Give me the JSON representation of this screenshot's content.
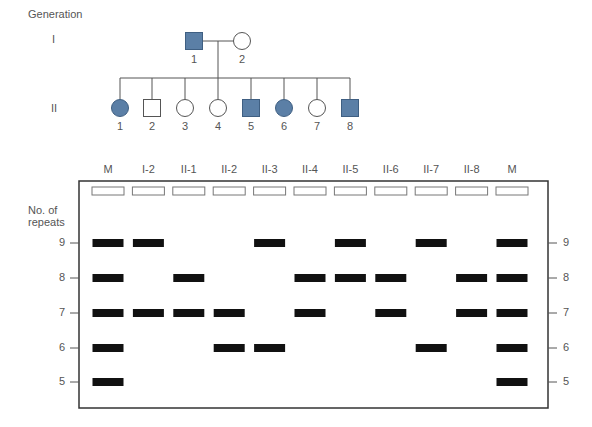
{
  "pedigree": {
    "generation_label": "Generation",
    "generations": [
      {
        "roman": "I",
        "members": [
          {
            "id": "1",
            "sex": "male",
            "affected": true,
            "x": 194
          },
          {
            "id": "2",
            "sex": "female",
            "affected": false,
            "x": 242
          }
        ]
      },
      {
        "roman": "II",
        "members": [
          {
            "id": "1",
            "sex": "female",
            "affected": true,
            "x": 120
          },
          {
            "id": "2",
            "sex": "male",
            "affected": false,
            "x": 152
          },
          {
            "id": "3",
            "sex": "female",
            "affected": false,
            "x": 185
          },
          {
            "id": "4",
            "sex": "female",
            "affected": false,
            "x": 218
          },
          {
            "id": "5",
            "sex": "male",
            "affected": true,
            "x": 251
          },
          {
            "id": "6",
            "sex": "female",
            "affected": true,
            "x": 284
          },
          {
            "id": "7",
            "sex": "female",
            "affected": false,
            "x": 317
          },
          {
            "id": "8",
            "sex": "male",
            "affected": true,
            "x": 350
          }
        ]
      }
    ],
    "affected_color": "#5b7fa6"
  },
  "gel": {
    "y_axis_label_line1": "No. of",
    "y_axis_label_line2": "repeats",
    "repeat_levels": [
      "9",
      "8",
      "7",
      "6",
      "5"
    ],
    "lanes": [
      {
        "label": "M",
        "bands": [
          9,
          8,
          7,
          6,
          5
        ]
      },
      {
        "label": "I-2",
        "bands": [
          9,
          7
        ]
      },
      {
        "label": "II-1",
        "bands": [
          8,
          7
        ]
      },
      {
        "label": "II-2",
        "bands": [
          7,
          6
        ]
      },
      {
        "label": "II-3",
        "bands": [
          9,
          6
        ]
      },
      {
        "label": "II-4",
        "bands": [
          8,
          7
        ]
      },
      {
        "label": "II-5",
        "bands": [
          9,
          8
        ]
      },
      {
        "label": "II-6",
        "bands": [
          8,
          7
        ]
      },
      {
        "label": "II-7",
        "bands": [
          9,
          6
        ]
      },
      {
        "label": "II-8",
        "bands": [
          8,
          7
        ]
      },
      {
        "label": "M",
        "bands": [
          9,
          8,
          7,
          6,
          5
        ]
      }
    ],
    "band_color": "#111111"
  },
  "chart_data": {
    "type": "table",
    "xlabel": "Individuals",
    "ylabel": "No. of repeats",
    "categories": [
      "M",
      "I-2",
      "II-1",
      "II-2",
      "II-3",
      "II-4",
      "II-5",
      "II-6",
      "II-7",
      "II-8",
      "M"
    ],
    "series": [
      {
        "name": "allele bands (repeats)",
        "values": [
          [
            9,
            8,
            7,
            6,
            5
          ],
          [
            9,
            7
          ],
          [
            8,
            7
          ],
          [
            7,
            6
          ],
          [
            9,
            6
          ],
          [
            8,
            7
          ],
          [
            9,
            8
          ],
          [
            8,
            7
          ],
          [
            9,
            6
          ],
          [
            8,
            7
          ],
          [
            9,
            8,
            7,
            6,
            5
          ]
        ]
      }
    ],
    "ylim": [
      5,
      9
    ]
  }
}
